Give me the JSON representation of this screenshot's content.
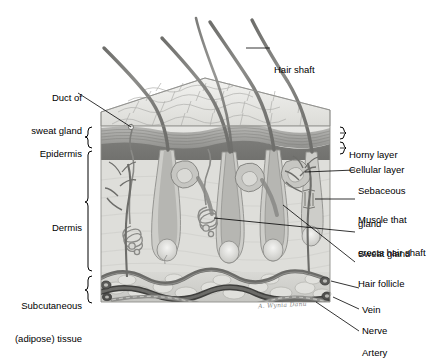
{
  "figure": {
    "artist_signature": "A. Wynia Danu"
  },
  "labels_left": [
    {
      "id": "duct-of-sweat-gland",
      "line1": "Duct of",
      "line2": "sweat gland",
      "x": 18,
      "y": 75
    },
    {
      "id": "epidermis",
      "line1": "Epidermis",
      "line2": "",
      "x": 36,
      "y": 130
    },
    {
      "id": "dermis",
      "line1": "Dermis",
      "line2": "",
      "x": 52,
      "y": 204
    },
    {
      "id": "subcutaneous-adipose-tissue",
      "line1": "Subcutaneous",
      "line2": "(adipose) tissue",
      "x": 10,
      "y": 282
    }
  ],
  "labels_right": [
    {
      "id": "hair-shaft",
      "line1": "Hair shaft",
      "line2": "",
      "x": 274,
      "y": 44
    },
    {
      "id": "horny-layer",
      "line1": "Horny layer",
      "line2": "",
      "x": 349,
      "y": 129
    },
    {
      "id": "cellular-layer",
      "line1": "Cellular layer",
      "line2": "",
      "x": 349,
      "y": 144
    },
    {
      "id": "sebaceous-gland",
      "line1": "Sebaceous",
      "line2": "gland",
      "x": 358,
      "y": 165
    },
    {
      "id": "muscle-that-erects-hair-shaft",
      "line1": "Muscle that",
      "line2": "erects hair shaft",
      "x": 358,
      "y": 194
    },
    {
      "id": "sweat-gland",
      "line1": "Sweat gland",
      "line2": "",
      "x": 358,
      "y": 228
    },
    {
      "id": "hair-follicle",
      "line1": "Hair follicle",
      "line2": "",
      "x": 358,
      "y": 258
    },
    {
      "id": "vein",
      "line1": "Vein",
      "line2": "",
      "x": 362,
      "y": 284
    },
    {
      "id": "nerve",
      "line1": "Nerve",
      "line2": "",
      "x": 362,
      "y": 305
    },
    {
      "id": "artery",
      "line1": "Artery",
      "line2": "",
      "x": 362,
      "y": 327
    }
  ],
  "colors": {
    "line": "#000000",
    "surface_light": "#e9e9e7",
    "surface_mid": "#d2d2cf",
    "horny_layer": "#9a9a97",
    "cellular_layer": "#6e6e6b",
    "dermis_fill": "#dcdcd8",
    "subcutaneous": "#d6d6d2",
    "vessel_dark": "#4a4a48",
    "vessel_mid": "#6f6f6c",
    "hair": "#7d7d7a",
    "background": "#ffffff"
  }
}
